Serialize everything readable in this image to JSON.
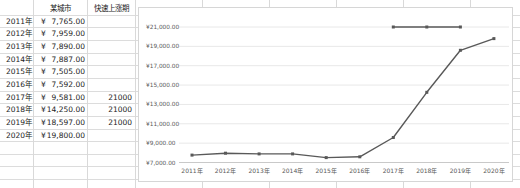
{
  "spreadsheet": {
    "currency_symbol": "¥",
    "col_b_header": "某城市",
    "col_c_header": "快速上涨期",
    "rows": [
      {
        "year": "2011年",
        "value": "7,765.00",
        "period": ""
      },
      {
        "year": "2012年",
        "value": "7,959.00",
        "period": ""
      },
      {
        "year": "2013年",
        "value": "7,890.00",
        "period": ""
      },
      {
        "year": "2014年",
        "value": "7,887.00",
        "period": ""
      },
      {
        "year": "2015年",
        "value": "7,505.00",
        "period": ""
      },
      {
        "year": "2016年",
        "value": "7,592.00",
        "period": ""
      },
      {
        "year": "2017年",
        "value": "9,581.00",
        "period": "21000"
      },
      {
        "year": "2018年",
        "value": "14,250.00",
        "period": "21000"
      },
      {
        "year": "2019年",
        "value": "18,597.00",
        "period": "21000"
      },
      {
        "year": "2020年",
        "value": "19,800.00",
        "period": ""
      }
    ]
  },
  "chart_data": {
    "type": "line",
    "title": "",
    "xlabel": "",
    "ylabel": "",
    "categories": [
      "2011年",
      "2012年",
      "2013年",
      "2014年",
      "2015年",
      "2016年",
      "2017年",
      "2018年",
      "2019年",
      "2020年"
    ],
    "series": [
      {
        "name": "某城市",
        "values": [
          7765,
          7959,
          7890,
          7887,
          7505,
          7592,
          9581,
          14250,
          18597,
          19800
        ]
      },
      {
        "name": "快速上涨期",
        "values": [
          null,
          null,
          null,
          null,
          null,
          null,
          21000,
          21000,
          21000,
          null
        ]
      }
    ],
    "ylim": [
      7000,
      21000
    ],
    "ytick_step": 2000,
    "ytick_labels": [
      "¥21,000.00",
      "¥19,000.00",
      "¥17,000.00",
      "¥15,000.00",
      "¥13,000.00",
      "¥11,000.00",
      "¥9,000.00",
      "¥7,000.00"
    ],
    "grid": true,
    "legend_position": "none",
    "marker": "square",
    "series_color": "#595959",
    "gridline_color": "#e8e8e8",
    "axis_line_color": "#c9c9c9",
    "axis_text_color": "#595959",
    "chart_border_color": "#d6d6d6"
  }
}
